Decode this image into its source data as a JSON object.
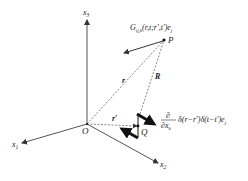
{
  "diagram": {
    "axes": {
      "x1": {
        "label": "x",
        "sub": "1"
      },
      "x2": {
        "label": "x",
        "sub": "2"
      },
      "x3": {
        "label": "x",
        "sub": "3"
      }
    },
    "points": {
      "origin": "O",
      "field_point": "P",
      "source_point": "Q"
    },
    "vectors": {
      "r": "r",
      "r_prime": "r′",
      "R": "R"
    },
    "labels": {
      "green_function": "G",
      "green_sub": "ij,k",
      "green_args": "(r,t;r′,t′)e",
      "green_e_sub": "j",
      "source_num": "∂",
      "source_den": "∂x",
      "source_den_sub": "k",
      "source_expr": "δ(r−r′)δ(t−t′)e",
      "source_e_sub": "j"
    },
    "colors": {
      "line": "#333333",
      "thick_arrow": "#111111",
      "background": "#ffffff"
    }
  }
}
